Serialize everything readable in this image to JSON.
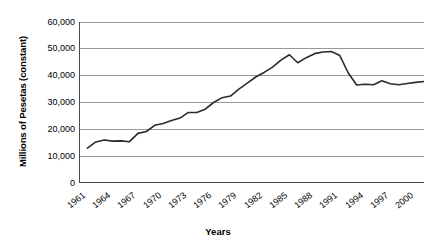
{
  "chart_data": {
    "type": "line",
    "title": "",
    "xlabel": "Years",
    "ylabel": "Millions of Pesetas (constant)",
    "ylim": [
      0,
      60000
    ],
    "xlim": [
      1961,
      2002
    ],
    "grid": true,
    "legend": "none",
    "y_ticks": [
      0,
      10000,
      20000,
      30000,
      40000,
      50000,
      60000
    ],
    "y_tick_labels": [
      "0",
      "10,000",
      "20,000",
      "30,000",
      "40,000",
      "50,000",
      "60,000"
    ],
    "x_tick_labels": [
      "1961",
      "1964",
      "1967",
      "1970",
      "1973",
      "1976",
      "1979",
      "1982",
      "1985",
      "1988",
      "1991",
      "1994",
      "1997",
      "2000"
    ],
    "x_tick_years": [
      1961,
      1964,
      1967,
      1970,
      1973,
      1976,
      1979,
      1982,
      1985,
      1988,
      1991,
      1994,
      1997,
      2000
    ],
    "series": [
      {
        "name": "Millions of Pesetas (constant)",
        "color": "#2b2b2b",
        "x": [
          1962,
          1963,
          1964,
          1965,
          1966,
          1967,
          1968,
          1969,
          1970,
          1971,
          1972,
          1973,
          1974,
          1975,
          1976,
          1977,
          1978,
          1979,
          1980,
          1981,
          1982,
          1983,
          1984,
          1985,
          1986,
          1987,
          1988,
          1989,
          1990,
          1991,
          1992,
          1993,
          1994,
          1995,
          1996,
          1997,
          1998,
          1999,
          2000,
          2001,
          2002
        ],
        "values": [
          13000,
          15300,
          16000,
          15600,
          15700,
          15400,
          18500,
          19200,
          21500,
          22200,
          23300,
          24200,
          26300,
          26300,
          27500,
          30000,
          31800,
          32400,
          35000,
          37200,
          39500,
          41200,
          43200,
          45800,
          47800,
          44800,
          46700,
          48200,
          48800,
          49000,
          47500,
          41000,
          36500,
          36800,
          36600,
          38100,
          37000,
          36600,
          37100,
          37500,
          37800
        ]
      }
    ]
  },
  "axes": {
    "y_axis_title": "Millions of Pesetas (constant)",
    "x_axis_title": "Years"
  }
}
